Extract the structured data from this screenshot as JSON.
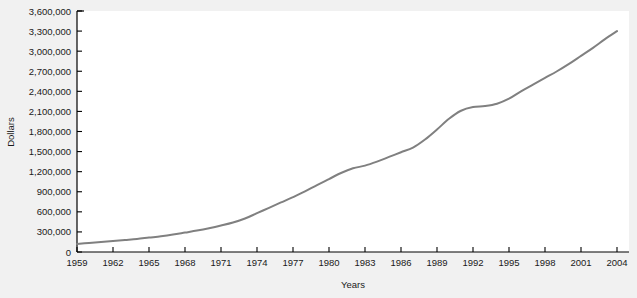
{
  "chart_data": {
    "type": "line",
    "title": "",
    "xlabel": "Years",
    "ylabel": "Dollars",
    "grid": false,
    "legend": "none",
    "xlim": [
      1959,
      2005
    ],
    "ylim": [
      0,
      3600000
    ],
    "x_tick_labels": [
      "1959",
      "1962",
      "1965",
      "1968",
      "1971",
      "1974",
      "1977",
      "1980",
      "1983",
      "1986",
      "1989",
      "1992",
      "1995",
      "1998",
      "2001",
      "2004"
    ],
    "x_ticks": [
      1959,
      1962,
      1965,
      1968,
      1971,
      1974,
      1977,
      1980,
      1983,
      1986,
      1989,
      1992,
      1995,
      1998,
      2001,
      2004
    ],
    "y_tick_labels": [
      "0",
      "300,000",
      "600,000",
      "900,000",
      "1,200,000",
      "1,500,000",
      "1,800,000",
      "2,100,000",
      "2,400,000",
      "2,700,000",
      "3,000,000",
      "3,300,000",
      "3,600,000"
    ],
    "y_ticks": [
      0,
      300000,
      600000,
      900000,
      1200000,
      1500000,
      1800000,
      2100000,
      2400000,
      2700000,
      3000000,
      3300000,
      3600000
    ],
    "line_color": "#808080",
    "line_width": 2,
    "series": [
      {
        "name": "Dollars",
        "x": [
          1959,
          1960,
          1961,
          1962,
          1963,
          1964,
          1965,
          1966,
          1967,
          1968,
          1969,
          1970,
          1971,
          1972,
          1973,
          1974,
          1975,
          1976,
          1977,
          1978,
          1979,
          1980,
          1981,
          1982,
          1983,
          1984,
          1985,
          1986,
          1987,
          1988,
          1989,
          1990,
          1991,
          1992,
          1993,
          1994,
          1995,
          1996,
          1997,
          1998,
          1999,
          2000,
          2001,
          2002,
          2003,
          2004
        ],
        "values": [
          120000,
          135000,
          150000,
          165000,
          180000,
          195000,
          215000,
          235000,
          260000,
          290000,
          320000,
          355000,
          395000,
          440000,
          500000,
          580000,
          660000,
          740000,
          820000,
          905000,
          1000000,
          1090000,
          1180000,
          1250000,
          1290000,
          1350000,
          1420000,
          1490000,
          1560000,
          1680000,
          1830000,
          1990000,
          2110000,
          2165000,
          2180000,
          2215000,
          2290000,
          2400000,
          2500000,
          2600000,
          2700000,
          2810000,
          2930000,
          3050000,
          3180000,
          3300000
        ]
      }
    ]
  },
  "axes": {
    "y_axis_title": "Dollars",
    "x_axis_title": "Years"
  }
}
